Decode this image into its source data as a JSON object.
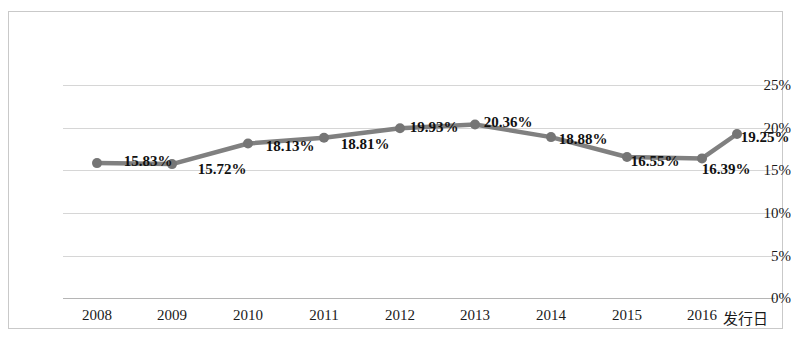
{
  "chart_data": {
    "type": "line",
    "title": "",
    "subtitle": "",
    "xlabel": "",
    "ylabel": "",
    "categories": [
      "2008",
      "2009",
      "2010",
      "2011",
      "2012",
      "2013",
      "2014",
      "2015",
      "2016",
      "发行日"
    ],
    "values": [
      15.83,
      15.72,
      18.13,
      18.81,
      19.93,
      20.36,
      18.88,
      16.55,
      16.39,
      19.25
    ],
    "data_labels": [
      "15.83%",
      "15.72%",
      "18.13%",
      "18.81%",
      "19.93%",
      "20.36%",
      "18.88%",
      "16.55%",
      "16.39%",
      "19.25%"
    ],
    "ylim": [
      0,
      25
    ],
    "ytick_labels": [
      "0%",
      "5%",
      "10%",
      "15%",
      "20%",
      "25%"
    ],
    "ytick_values": [
      0,
      5,
      10,
      15,
      20,
      25
    ],
    "grid": true,
    "grid_axis": "y",
    "legend": "none",
    "series": [
      {
        "name": "",
        "values": [
          15.83,
          15.72,
          18.13,
          18.81,
          19.93,
          20.36,
          18.88,
          16.55,
          16.39,
          19.25
        ]
      }
    ],
    "colors": {
      "line": "#808080",
      "marker": "#757575",
      "gridline": "#d6d6d6",
      "axis": "#b5b5b5",
      "border": "#c9c9c9",
      "text": "#1a1a1a",
      "background": "#ffffff"
    },
    "marker_style": "circle",
    "line_width_px": 4
  }
}
